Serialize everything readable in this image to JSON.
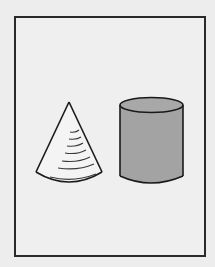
{
  "figure": {
    "shapes": [
      {
        "name": "cone",
        "fill": "#f4f4f4",
        "stroke": "#1a1a1a",
        "hatched": true
      },
      {
        "name": "cylinder",
        "fill": "#a3a3a3",
        "stroke": "#1a1a1a"
      }
    ],
    "colors": {
      "background": "#ededed",
      "frame": "#2a2a2a",
      "cylinder_fill": "#a3a3a3",
      "cone_fill": "#f4f4f4"
    }
  }
}
